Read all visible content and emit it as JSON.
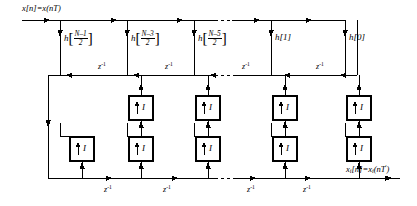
{
  "figure": {
    "type": "signal-flow-diagram",
    "input_label": "x[n]=x(nT)",
    "output_label": "xi[n]=xi(nT')",
    "output_label_parts": {
      "base": "x",
      "sub": "i",
      "index": "[n]=",
      "base2": "x",
      "sub2": "i",
      "arg": "(nT",
      "prime": "'",
      "close": ")"
    },
    "delay_label": "z",
    "delay_exponent": "-1",
    "upsampler_label": "I",
    "upsampler_arrow": "up-arrow-icon",
    "taps": [
      {
        "id": "tap-0",
        "kind": "fraction",
        "name": "h",
        "numerator": "N–1",
        "denominator": "2",
        "text": "h[(N-1)/2]"
      },
      {
        "id": "tap-1",
        "kind": "fraction",
        "name": "h",
        "numerator": "N–3",
        "denominator": "2",
        "text": "h[(N-3)/2]"
      },
      {
        "id": "tap-2",
        "kind": "fraction",
        "name": "h",
        "numerator": "N–5",
        "denominator": "2",
        "text": "h[(N-5)/2]"
      },
      {
        "id": "tap-3",
        "kind": "plain",
        "text": "h[1]"
      },
      {
        "id": "tap-4",
        "kind": "plain",
        "text": "h[0]"
      }
    ],
    "top_delay_labels": [
      "z-1",
      "z-1",
      "z-1",
      "z-1"
    ],
    "bottom_delay_labels": [
      "z-1",
      "z-1",
      "z-1",
      "z-1"
    ],
    "upsampler_count": 8,
    "colors": {
      "line": "#000000",
      "background": "#ffffff",
      "box_stroke": "#000000"
    }
  }
}
